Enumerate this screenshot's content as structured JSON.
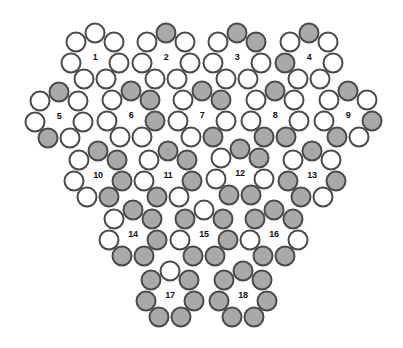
{
  "diagram": {
    "colors": {
      "outline": "#4a4a4a",
      "filled": "#a9a9a9",
      "empty": "#ffffff",
      "label": "#111111"
    },
    "ring_positions": [
      "top",
      "upper-right",
      "right",
      "lower-right",
      "lower-left",
      "left",
      "upper-left"
    ],
    "clusters": [
      {
        "label": "1",
        "cx": 95,
        "cy": 57,
        "filled": []
      },
      {
        "label": "2",
        "cx": 166,
        "cy": 57,
        "filled": [
          "top"
        ]
      },
      {
        "label": "3",
        "cx": 237,
        "cy": 57,
        "filled": [
          "top",
          "upper-right"
        ]
      },
      {
        "label": "4",
        "cx": 309,
        "cy": 57,
        "filled": [
          "top",
          "left"
        ]
      },
      {
        "label": "5",
        "cx": 59,
        "cy": 116,
        "filled": [
          "top",
          "lower-left"
        ]
      },
      {
        "label": "6",
        "cx": 131,
        "cy": 115,
        "filled": [
          "top",
          "upper-right",
          "right"
        ]
      },
      {
        "label": "7",
        "cx": 202,
        "cy": 115,
        "filled": [
          "top",
          "upper-right",
          "lower-right"
        ]
      },
      {
        "label": "8",
        "cx": 275,
        "cy": 115,
        "filled": [
          "top",
          "lower-right",
          "lower-left"
        ]
      },
      {
        "label": "9",
        "cx": 348,
        "cy": 115,
        "filled": [
          "top",
          "right",
          "lower-left"
        ]
      },
      {
        "label": "10",
        "cx": 98,
        "cy": 175,
        "filled": [
          "top",
          "upper-right",
          "right",
          "lower-right"
        ]
      },
      {
        "label": "11",
        "cx": 168,
        "cy": 175,
        "filled": [
          "top",
          "upper-right",
          "right",
          "lower-left"
        ]
      },
      {
        "label": "12",
        "cx": 240,
        "cy": 173,
        "filled": [
          "top",
          "upper-right",
          "lower-right",
          "lower-left"
        ]
      },
      {
        "label": "13",
        "cx": 312,
        "cy": 175,
        "filled": [
          "top",
          "right",
          "lower-left",
          "left"
        ]
      },
      {
        "label": "14",
        "cx": 133,
        "cy": 234,
        "filled": [
          "top",
          "upper-right",
          "right",
          "lower-right",
          "lower-left"
        ]
      },
      {
        "label": "15",
        "cx": 204,
        "cy": 234,
        "filled": [
          "upper-right",
          "right",
          "lower-right",
          "lower-left",
          "upper-left"
        ]
      },
      {
        "label": "16",
        "cx": 274,
        "cy": 234,
        "filled": [
          "top",
          "upper-right",
          "lower-right",
          "lower-left",
          "upper-left"
        ]
      },
      {
        "label": "17",
        "cx": 170,
        "cy": 295,
        "filled": [
          "upper-right",
          "right",
          "lower-right",
          "lower-left",
          "left",
          "upper-left"
        ]
      },
      {
        "label": "18",
        "cx": 243,
        "cy": 295,
        "filled": [
          "top",
          "upper-right",
          "right",
          "lower-right",
          "lower-left",
          "left",
          "upper-left"
        ]
      }
    ]
  }
}
